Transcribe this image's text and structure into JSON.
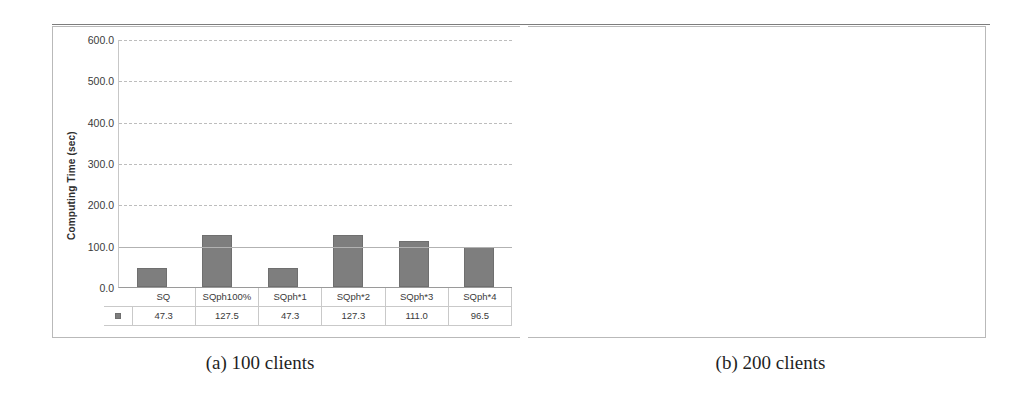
{
  "figure": {
    "panels": [
      {
        "caption": "(a) 100 clients",
        "legend_marker": "square-marker",
        "chart_data": {
          "type": "bar",
          "title": "",
          "subtitle": "",
          "xlabel": "",
          "ylabel": "Computing Time (sec)",
          "categories": [
            "SQ",
            "SQph100%",
            "SQph*1",
            "SQph*2",
            "SQph*3",
            "SQph*4"
          ],
          "values": [
            47.3,
            127.5,
            47.3,
            127.3,
            111.0,
            96.5
          ],
          "value_labels": [
            "47.3",
            "127.5",
            "47.3",
            "127.3",
            "111.0",
            "96.5"
          ],
          "ylim": [
            0,
            600
          ],
          "ytick_step": 100,
          "ytick_labels": [
            "600.0",
            "500.0",
            "400.0",
            "300.0",
            "200.0",
            "100.0",
            "0.0"
          ],
          "ytick_values": [
            600,
            500,
            400,
            300,
            200,
            100,
            0
          ],
          "grid": true,
          "legend_position": "data-table",
          "series_color": "#7e7e7e"
        }
      },
      {
        "caption": "(b) 200 clients",
        "legend_marker": "square-marker",
        "chart_data": {
          "type": "bar",
          "title": "",
          "subtitle": "",
          "xlabel": "",
          "ylabel": "Computing Time (sec)",
          "categories": [
            "SQ",
            "SQph100%",
            "SQph*1",
            "SQph*2",
            "SQph*3",
            "SQph*4"
          ],
          "values": [
            195.0,
            528.5,
            194.7,
            527.5,
            448.3,
            391.3
          ],
          "value_labels": [
            "195.0",
            "528.5",
            "194.7",
            "527.5",
            "448.3",
            "391.3"
          ],
          "ylim": [
            0,
            600
          ],
          "ytick_step": 100,
          "ytick_labels": [
            "600.0",
            "500.0",
            "400.0",
            "300.0",
            "200.0",
            "100.0",
            "0.0"
          ],
          "ytick_values": [
            600,
            500,
            400,
            300,
            200,
            100,
            0
          ],
          "grid": true,
          "legend_position": "data-table",
          "series_color": "#7e7e7e"
        }
      }
    ]
  }
}
